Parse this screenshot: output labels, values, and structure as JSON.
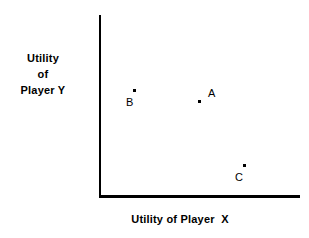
{
  "figure": {
    "background_color": "#ffffff",
    "ink_color": "#000000",
    "axis_title_y": {
      "line1": "Utility",
      "line2": "of",
      "line3": "Player Y"
    },
    "axis_title_x": "Utility of Player  X"
  },
  "chart_data": {
    "type": "scatter",
    "title": "",
    "xlabel": "Utility of Player  X",
    "ylabel": "Utility of Player Y",
    "grid": false,
    "legend": false,
    "axes": {
      "style": "L-shaped open axes, no tick marks, no tick labels",
      "x_origin_px": 99,
      "y_origin_px": 196,
      "x_end_px": 300,
      "y_top_px": 15
    },
    "points": [
      {
        "label": "A",
        "dot_px": [
          198,
          100
        ],
        "label_px": [
          208,
          88
        ],
        "label_position": "upper-right",
        "x_rel": 0.49,
        "y_rel": 0.53
      },
      {
        "label": "B",
        "dot_px": [
          133,
          89
        ],
        "label_px": [
          126,
          97
        ],
        "label_position": "lower-left",
        "x_rel": 0.17,
        "y_rel": 0.59
      },
      {
        "label": "C",
        "dot_px": [
          243,
          164
        ],
        "label_px": [
          235,
          172
        ],
        "label_position": "lower-left",
        "x_rel": 0.72,
        "y_rel": 0.18
      }
    ]
  }
}
